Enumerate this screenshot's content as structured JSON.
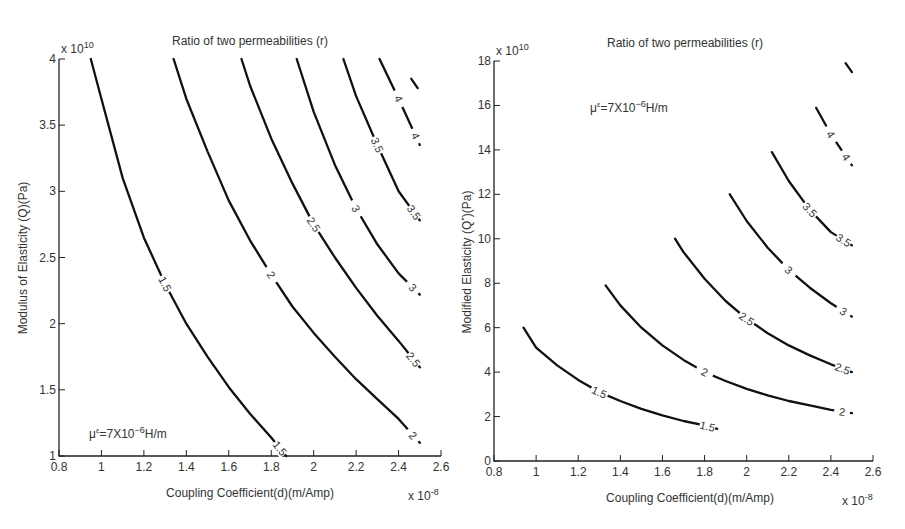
{
  "chart_data": [
    {
      "type": "line",
      "subtype": "contour",
      "title": "Ratio of two permeabilities (r)",
      "xlabel": "Coupling Coefficient(d)(m/Amp)",
      "ylabel": "Modulus of Elasticity (Q)(Pa)",
      "x_multiplier": "x 10^-8",
      "y_multiplier": "x 10^10",
      "xlim": [
        0.8,
        2.6
      ],
      "ylim": [
        1,
        4
      ],
      "xticks": [
        0.8,
        1,
        1.2,
        1.4,
        1.6,
        1.8,
        2,
        2.2,
        2.4,
        2.6
      ],
      "yticks": [
        1,
        1.5,
        2,
        2.5,
        3,
        3.5,
        4
      ],
      "grid": false,
      "annotation": "μ^ε=7X10^-6 H/m",
      "annotation_position": "bottom-left",
      "series": [
        {
          "name": "1.5",
          "x": [
            0.95,
            1.0,
            1.1,
            1.2,
            1.3,
            1.4,
            1.5,
            1.6,
            1.7,
            1.8,
            1.87
          ],
          "y": [
            4.0,
            3.7,
            3.1,
            2.65,
            2.3,
            2.0,
            1.75,
            1.52,
            1.32,
            1.14,
            1.0
          ]
        },
        {
          "name": "2",
          "x": [
            1.34,
            1.4,
            1.5,
            1.6,
            1.7,
            1.8,
            1.9,
            2.0,
            2.1,
            2.2,
            2.3,
            2.4,
            2.5
          ],
          "y": [
            4.0,
            3.7,
            3.3,
            2.93,
            2.63,
            2.37,
            2.13,
            1.93,
            1.75,
            1.58,
            1.43,
            1.28,
            1.1
          ]
        },
        {
          "name": "2.5",
          "x": [
            1.66,
            1.7,
            1.8,
            1.9,
            2.0,
            2.1,
            2.2,
            2.3,
            2.4,
            2.5
          ],
          "y": [
            4.0,
            3.8,
            3.4,
            3.06,
            2.75,
            2.5,
            2.27,
            2.06,
            1.87,
            1.67
          ]
        },
        {
          "name": "3",
          "x": [
            1.92,
            2.0,
            2.1,
            2.2,
            2.3,
            2.4,
            2.5
          ],
          "y": [
            4.0,
            3.6,
            3.2,
            2.87,
            2.6,
            2.38,
            2.22
          ]
        },
        {
          "name": "3.5",
          "x": [
            2.14,
            2.2,
            2.3,
            2.4,
            2.5
          ],
          "y": [
            4.0,
            3.72,
            3.35,
            3.0,
            2.78
          ]
        },
        {
          "name": "4",
          "x": [
            2.31,
            2.4,
            2.5
          ],
          "y": [
            4.0,
            3.7,
            3.35
          ]
        },
        {
          "name": "4.5",
          "x": [
            2.46,
            2.49
          ],
          "y": [
            3.85,
            3.78
          ]
        }
      ]
    },
    {
      "type": "line",
      "subtype": "contour",
      "title": "Ratio of two permeabilities (r)",
      "xlabel": "Coupling Coefficient(d)(m/Amp)",
      "ylabel": "Modified Elasticity (Q*)(Pa)",
      "x_multiplier": "x 10^-8",
      "y_multiplier": "x 10^10",
      "xlim": [
        0.8,
        2.6
      ],
      "ylim": [
        0,
        18
      ],
      "xticks": [
        0.8,
        1,
        1.2,
        1.4,
        1.6,
        1.8,
        2,
        2.2,
        2.4,
        2.6
      ],
      "yticks": [
        0,
        2,
        4,
        6,
        8,
        10,
        12,
        14,
        16,
        18
      ],
      "grid": false,
      "annotation": "μ^ε=7X10^-6 H/m",
      "annotation_position": "top-left",
      "series": [
        {
          "name": "1.5",
          "x": [
            0.94,
            1.0,
            1.1,
            1.2,
            1.3,
            1.4,
            1.5,
            1.6,
            1.7,
            1.8,
            1.86
          ],
          "y": [
            6.0,
            5.1,
            4.3,
            3.65,
            3.1,
            2.7,
            2.35,
            2.05,
            1.8,
            1.6,
            1.45
          ]
        },
        {
          "name": "2",
          "x": [
            1.33,
            1.4,
            1.5,
            1.6,
            1.7,
            1.8,
            1.9,
            2.0,
            2.1,
            2.2,
            2.3,
            2.4,
            2.5
          ],
          "y": [
            7.9,
            7.0,
            6.0,
            5.2,
            4.55,
            4.0,
            3.6,
            3.25,
            2.95,
            2.7,
            2.5,
            2.3,
            2.15
          ]
        },
        {
          "name": "2.5",
          "x": [
            1.66,
            1.7,
            1.8,
            1.9,
            2.0,
            2.1,
            2.2,
            2.3,
            2.4,
            2.5
          ],
          "y": [
            10.0,
            9.4,
            8.2,
            7.2,
            6.4,
            5.75,
            5.2,
            4.75,
            4.35,
            4.0
          ]
        },
        {
          "name": "3",
          "x": [
            1.92,
            2.0,
            2.1,
            2.2,
            2.3,
            2.4,
            2.5
          ],
          "y": [
            12.0,
            10.8,
            9.6,
            8.6,
            7.8,
            7.1,
            6.5
          ]
        },
        {
          "name": "3.5",
          "x": [
            2.12,
            2.2,
            2.3,
            2.4,
            2.5
          ],
          "y": [
            13.9,
            12.6,
            11.3,
            10.3,
            9.7
          ]
        },
        {
          "name": "4",
          "x": [
            2.33,
            2.4,
            2.5
          ],
          "y": [
            15.9,
            14.7,
            13.3
          ]
        },
        {
          "name": "4.5",
          "x": [
            2.47,
            2.5
          ],
          "y": [
            17.9,
            17.5
          ]
        }
      ]
    }
  ],
  "plots": [
    {
      "title": "Ratio of two permeabilities (r)",
      "xlabel": "Coupling Coefficient(d)(m/Amp)",
      "ylabel": "Modulus of Elasticity (Q)(Pa)",
      "y_exp_base": "x 10",
      "y_exp_power": "10",
      "x_exp_base": "x 10",
      "x_exp_power": "-8",
      "annotation_mu": "μ",
      "annotation_sup": "ε",
      "annotation_mid": "=7X10",
      "annotation_pow": "−6",
      "annotation_unit": "H/m"
    },
    {
      "title": "Ratio of two permeabilities (r)",
      "xlabel": "Coupling Coefficient(d)(m/Amp)",
      "ylabel": "Modified Elasticity (Q",
      "ylabel_sup": "*",
      "ylabel_end": ")(Pa)",
      "y_exp_base": "x 10",
      "y_exp_power": "10",
      "x_exp_base": "x 10",
      "x_exp_power": "-8",
      "annotation_mu": "μ",
      "annotation_sup": "ε",
      "annotation_mid": "=7X10",
      "annotation_pow": "−6",
      "annotation_unit": "H/m"
    }
  ]
}
